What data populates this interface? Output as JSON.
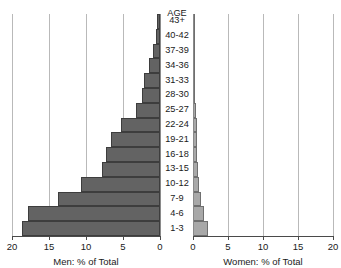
{
  "chart_data": {
    "type": "bar",
    "subtype": "population-pyramid",
    "title": "",
    "categories": [
      "1-3",
      "4-6",
      "7-9",
      "10-12",
      "13-15",
      "16-18",
      "19-21",
      "22-24",
      "25-27",
      "28-30",
      "31-33",
      "34-36",
      "37-39",
      "40-42",
      "43+"
    ],
    "category_header": "AGE",
    "category_order": "bottom-to-top",
    "series": [
      {
        "name": "Men: % of Total",
        "side": "left",
        "color": "#636363",
        "values": [
          18.6,
          17.8,
          13.8,
          10.7,
          7.8,
          7.3,
          6.6,
          5.3,
          3.2,
          2.4,
          2.2,
          1.5,
          1.0,
          0.6,
          0.4
        ]
      },
      {
        "name": "Women: % of Total",
        "side": "right",
        "color": "#a8a8a8",
        "values": [
          2.1,
          1.6,
          1.2,
          0.8,
          0.7,
          0.6,
          0.6,
          0.5,
          0.4,
          0.2,
          0.2,
          0.2,
          0.1,
          0.0,
          0.0
        ]
      }
    ],
    "xlabel_left": "Men: % of Total",
    "xlabel_right": "Women: % of Total",
    "ylabel": "AGE",
    "xlim_left": [
      0,
      20
    ],
    "xlim_right": [
      0,
      20
    ],
    "xticks_left": [
      "20",
      "15",
      "10",
      "5",
      "0"
    ],
    "xticks_right": [
      "0",
      "5",
      "10",
      "15",
      "20"
    ],
    "grid": true,
    "legend": "none"
  },
  "axes": {
    "men": {
      "ticks": [
        {
          "label": "20",
          "value": 20
        },
        {
          "label": "15",
          "value": 15
        },
        {
          "label": "10",
          "value": 10
        },
        {
          "label": "5",
          "value": 5
        },
        {
          "label": "0",
          "value": 0
        }
      ],
      "caption": "Men: % of Total"
    },
    "women": {
      "ticks": [
        {
          "label": "0",
          "value": 0
        },
        {
          "label": "5",
          "value": 5
        },
        {
          "label": "10",
          "value": 10
        },
        {
          "label": "15",
          "value": 15
        },
        {
          "label": "20",
          "value": 20
        }
      ],
      "caption": "Women: % of Total"
    }
  },
  "colors": {
    "men_bar": "#636363",
    "women_bar": "#a8a8a8",
    "gridline": "#b9b9b9",
    "axis": "#4a4a4a",
    "text": "#1a1a1a",
    "background": "#ffffff"
  }
}
